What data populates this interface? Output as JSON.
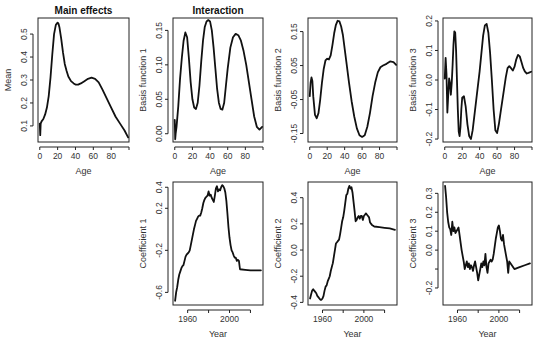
{
  "figure": {
    "column_titles": [
      "Main effects",
      "Interaction"
    ]
  },
  "chart_data": [
    {
      "type": "line",
      "panel": "top-1",
      "title": "Main effects",
      "xlabel": "Age",
      "ylabel": "Mean",
      "xlim": [
        -2,
        100
      ],
      "ylim": [
        0.03,
        0.57
      ],
      "xticks": [
        0,
        20,
        40,
        60,
        80,
        100
      ],
      "xtick_labels": [
        "0",
        "20",
        "40",
        "60",
        "80",
        ""
      ],
      "yticks": [
        0.1,
        0.2,
        0.3,
        0.4,
        0.5
      ],
      "ytick_labels": [
        "0.1",
        "0.2",
        "0.3",
        "0.4",
        "0.5"
      ],
      "x": [
        0,
        0.5,
        1,
        2,
        4,
        6,
        8,
        10,
        12,
        14,
        16,
        18,
        20,
        21,
        22,
        24,
        26,
        28,
        30,
        32,
        35,
        38,
        40,
        43,
        46,
        50,
        54,
        58,
        62,
        66,
        70,
        75,
        80,
        85,
        90,
        95,
        99
      ],
      "y": [
        0.11,
        0.06,
        0.11,
        0.12,
        0.13,
        0.15,
        0.18,
        0.23,
        0.31,
        0.41,
        0.5,
        0.54,
        0.55,
        0.545,
        0.53,
        0.48,
        0.42,
        0.37,
        0.34,
        0.315,
        0.295,
        0.285,
        0.28,
        0.28,
        0.285,
        0.295,
        0.305,
        0.31,
        0.305,
        0.29,
        0.26,
        0.22,
        0.18,
        0.14,
        0.11,
        0.08,
        0.05
      ]
    },
    {
      "type": "line",
      "panel": "top-2",
      "title": "Interaction",
      "xlabel": "Age",
      "ylabel": "Basis function 1",
      "xlim": [
        -2,
        100
      ],
      "ylim": [
        -0.012,
        0.168
      ],
      "xticks": [
        0,
        20,
        40,
        60,
        80,
        100
      ],
      "xtick_labels": [
        "0",
        "20",
        "40",
        "60",
        "80",
        ""
      ],
      "yticks": [
        0.0,
        0.05,
        0.1,
        0.15
      ],
      "ytick_labels": [
        "0.00",
        "0.05",
        "0.10",
        "0.15"
      ],
      "x": [
        0,
        0.5,
        1,
        2,
        4,
        6,
        8,
        10,
        12,
        14,
        16,
        18,
        20,
        22,
        24,
        26,
        28,
        30,
        32,
        34,
        36,
        38,
        40,
        42,
        44,
        46,
        48,
        50,
        52,
        54,
        56,
        58,
        60,
        63,
        66,
        69,
        72,
        75,
        78,
        81,
        84,
        87,
        90,
        93,
        96,
        99
      ],
      "y": [
        0.02,
        -0.008,
        0.0,
        0.01,
        0.04,
        0.08,
        0.11,
        0.135,
        0.147,
        0.14,
        0.11,
        0.075,
        0.05,
        0.038,
        0.036,
        0.045,
        0.07,
        0.105,
        0.135,
        0.155,
        0.163,
        0.165,
        0.163,
        0.15,
        0.125,
        0.095,
        0.065,
        0.045,
        0.036,
        0.035,
        0.045,
        0.07,
        0.095,
        0.125,
        0.14,
        0.145,
        0.143,
        0.135,
        0.12,
        0.1,
        0.075,
        0.05,
        0.025,
        0.01,
        0.006,
        0.01
      ]
    },
    {
      "type": "line",
      "panel": "top-3",
      "xlabel": "Age",
      "ylabel": "Basis function 2",
      "xlim": [
        -2,
        100
      ],
      "ylim": [
        -0.175,
        0.19
      ],
      "xticks": [
        0,
        20,
        40,
        60,
        80,
        100
      ],
      "xtick_labels": [
        "0",
        "20",
        "40",
        "60",
        "80",
        ""
      ],
      "yticks": [
        -0.15,
        -0.05,
        0.05,
        0.15
      ],
      "ytick_labels": [
        "-0.15",
        "-0.05",
        "0.05",
        "0.15"
      ],
      "x": [
        0,
        1,
        2,
        3,
        4,
        6,
        8,
        10,
        12,
        14,
        16,
        18,
        20,
        22,
        24,
        26,
        28,
        30,
        32,
        34,
        36,
        38,
        40,
        42,
        45,
        48,
        51,
        54,
        57,
        60,
        63,
        66,
        69,
        72,
        75,
        78,
        81,
        84,
        88,
        92,
        96,
        99
      ],
      "y": [
        -0.04,
        0.0,
        0.015,
        0.005,
        -0.04,
        -0.095,
        -0.105,
        -0.09,
        -0.05,
        0.0,
        0.04,
        0.065,
        0.07,
        0.068,
        0.08,
        0.11,
        0.145,
        0.17,
        0.182,
        0.18,
        0.165,
        0.14,
        0.1,
        0.06,
        0.0,
        -0.055,
        -0.1,
        -0.135,
        -0.155,
        -0.16,
        -0.155,
        -0.13,
        -0.09,
        -0.04,
        0.0,
        0.03,
        0.045,
        0.05,
        0.055,
        0.062,
        0.06,
        0.052
      ]
    },
    {
      "type": "line",
      "panel": "top-4",
      "xlabel": "Age",
      "ylabel": "Basis function 3",
      "xlim": [
        -2,
        100
      ],
      "ylim": [
        -0.21,
        0.21
      ],
      "xticks": [
        0,
        20,
        40,
        60,
        80,
        100
      ],
      "xtick_labels": [
        "0",
        "20",
        "40",
        "60",
        "80",
        ""
      ],
      "yticks": [
        -0.2,
        -0.1,
        0.0,
        0.1,
        0.2
      ],
      "ytick_labels": [
        "-0.2",
        "-0.1",
        "0.0",
        "0.1",
        "0.2"
      ],
      "x": [
        0,
        1,
        2,
        3,
        4,
        5,
        6,
        7,
        8,
        9,
        10,
        11,
        12,
        13,
        14,
        15,
        16,
        17,
        18,
        19,
        20,
        22,
        24,
        26,
        28,
        30,
        32,
        34,
        36,
        38,
        40,
        42,
        44,
        46,
        48,
        50,
        52,
        54,
        56,
        58,
        60,
        62,
        64,
        66,
        68,
        70,
        72,
        74,
        76,
        78,
        80,
        82,
        84,
        86,
        88,
        90,
        92,
        94,
        96,
        99
      ],
      "y": [
        0.005,
        0.075,
        0.02,
        -0.11,
        -0.05,
        0.005,
        -0.01,
        -0.05,
        -0.01,
        0.05,
        0.12,
        0.165,
        0.16,
        0.1,
        0.0,
        -0.1,
        -0.175,
        -0.19,
        -0.16,
        -0.1,
        -0.06,
        -0.055,
        -0.09,
        -0.15,
        -0.19,
        -0.2,
        -0.17,
        -0.12,
        -0.07,
        -0.02,
        0.03,
        0.09,
        0.15,
        0.185,
        0.19,
        0.16,
        0.09,
        0.0,
        -0.1,
        -0.17,
        -0.18,
        -0.15,
        -0.11,
        -0.07,
        -0.03,
        0.01,
        0.04,
        0.047,
        0.04,
        0.032,
        0.045,
        0.07,
        0.085,
        0.08,
        0.06,
        0.04,
        0.028,
        0.022,
        0.024,
        0.028
      ]
    },
    {
      "type": "line",
      "panel": "bottom-2",
      "xlabel": "Year",
      "ylabel": "Coefficient 1",
      "xlim": [
        1946,
        2032
      ],
      "ylim": [
        -0.72,
        0.45
      ],
      "xticks": [
        1960,
        1980,
        2000,
        2020
      ],
      "xtick_labels": [
        "1960",
        "",
        "2000",
        ""
      ],
      "yticks": [
        -0.6,
        -0.2,
        0.2,
        0.4
      ],
      "ytick_labels": [
        "-0.6",
        "-0.2",
        "0.2",
        "0.4"
      ],
      "x": [
        1948,
        1949,
        1950,
        1951,
        1952,
        1953,
        1954,
        1955,
        1956,
        1957,
        1958,
        1959,
        1960,
        1961,
        1962,
        1963,
        1964,
        1965,
        1966,
        1967,
        1968,
        1969,
        1970,
        1971,
        1972,
        1973,
        1974,
        1975,
        1976,
        1977,
        1978,
        1979,
        1980,
        1981,
        1982,
        1983,
        1984,
        1985,
        1986,
        1987,
        1988,
        1989,
        1990,
        1991,
        1992,
        1993,
        1994,
        1995,
        1996,
        1997,
        1998,
        1999,
        2000,
        2001,
        2002,
        2003,
        2004,
        2005,
        2006,
        2007,
        2008,
        2009,
        2010,
        2015,
        2020,
        2025,
        2030
      ],
      "y": [
        -0.68,
        -0.6,
        -0.55,
        -0.48,
        -0.43,
        -0.4,
        -0.37,
        -0.35,
        -0.34,
        -0.3,
        -0.26,
        -0.24,
        -0.23,
        -0.22,
        -0.2,
        -0.15,
        -0.1,
        -0.05,
        0.0,
        0.04,
        0.08,
        0.1,
        0.12,
        0.13,
        0.13,
        0.16,
        0.2,
        0.25,
        0.28,
        0.3,
        0.31,
        0.32,
        0.36,
        0.32,
        0.33,
        0.3,
        0.28,
        0.26,
        0.32,
        0.39,
        0.41,
        0.36,
        0.38,
        0.37,
        0.4,
        0.42,
        0.41,
        0.39,
        0.35,
        0.27,
        0.15,
        0.02,
        -0.08,
        -0.15,
        -0.2,
        -0.22,
        -0.25,
        -0.27,
        -0.27,
        -0.3,
        -0.29,
        -0.3,
        -0.38,
        -0.385,
        -0.39,
        -0.39,
        -0.39
      ]
    },
    {
      "type": "line",
      "panel": "bottom-3",
      "xlabel": "Year",
      "ylabel": "Coefficient 2",
      "xlim": [
        1946,
        2032
      ],
      "ylim": [
        -0.42,
        0.52
      ],
      "xticks": [
        1960,
        1980,
        2000,
        2020
      ],
      "xtick_labels": [
        "1960",
        "",
        "2000",
        ""
      ],
      "yticks": [
        -0.4,
        -0.2,
        0.0,
        0.2,
        0.4
      ],
      "ytick_labels": [
        "-0.4",
        "-0.2",
        "0.0",
        "0.2",
        "0.4"
      ],
      "x": [
        1948,
        1949,
        1950,
        1951,
        1952,
        1953,
        1954,
        1955,
        1956,
        1957,
        1958,
        1959,
        1960,
        1961,
        1962,
        1963,
        1964,
        1965,
        1966,
        1967,
        1968,
        1969,
        1970,
        1971,
        1972,
        1973,
        1974,
        1975,
        1976,
        1977,
        1978,
        1979,
        1980,
        1981,
        1982,
        1983,
        1984,
        1985,
        1986,
        1987,
        1988,
        1989,
        1990,
        1991,
        1992,
        1993,
        1994,
        1995,
        1996,
        1997,
        1998,
        1999,
        2000,
        2001,
        2002,
        2003,
        2004,
        2005,
        2006,
        2007,
        2008,
        2009,
        2010,
        2015,
        2020,
        2025,
        2030
      ],
      "y": [
        -0.37,
        -0.34,
        -0.31,
        -0.3,
        -0.31,
        -0.32,
        -0.33,
        -0.35,
        -0.36,
        -0.37,
        -0.38,
        -0.38,
        -0.37,
        -0.35,
        -0.31,
        -0.28,
        -0.27,
        -0.24,
        -0.22,
        -0.2,
        -0.16,
        -0.13,
        -0.1,
        -0.05,
        0.0,
        0.05,
        0.06,
        0.07,
        0.08,
        0.12,
        0.17,
        0.22,
        0.25,
        0.3,
        0.36,
        0.42,
        0.43,
        0.47,
        0.49,
        0.47,
        0.48,
        0.44,
        0.37,
        0.3,
        0.22,
        0.23,
        0.25,
        0.26,
        0.24,
        0.26,
        0.26,
        0.23,
        0.26,
        0.27,
        0.28,
        0.27,
        0.26,
        0.25,
        0.21,
        0.2,
        0.19,
        0.185,
        0.18,
        0.175,
        0.17,
        0.165,
        0.155
      ]
    },
    {
      "type": "line",
      "panel": "bottom-4",
      "xlabel": "Year",
      "ylabel": "Coefficient 3",
      "xlim": [
        1946,
        2032
      ],
      "ylim": [
        -0.29,
        0.36
      ],
      "xticks": [
        1960,
        1980,
        2000,
        2020
      ],
      "xtick_labels": [
        "1960",
        "",
        "2000",
        ""
      ],
      "yticks": [
        -0.2,
        -0.1,
        0.0,
        0.1,
        0.2,
        0.3
      ],
      "ytick_labels": [
        "-0.2",
        "",
        "0.0",
        "0.1",
        "0.2",
        "0.3"
      ],
      "x": [
        1948,
        1949,
        1950,
        1951,
        1952,
        1953,
        1954,
        1955,
        1956,
        1957,
        1958,
        1959,
        1960,
        1961,
        1962,
        1963,
        1964,
        1965,
        1966,
        1967,
        1968,
        1969,
        1970,
        1971,
        1972,
        1973,
        1974,
        1975,
        1976,
        1977,
        1978,
        1979,
        1980,
        1981,
        1982,
        1983,
        1984,
        1985,
        1986,
        1987,
        1988,
        1989,
        1990,
        1991,
        1992,
        1993,
        1994,
        1995,
        1996,
        1997,
        1998,
        1999,
        2000,
        2001,
        2002,
        2003,
        2004,
        2005,
        2006,
        2007,
        2008,
        2009,
        2010,
        2015,
        2020,
        2025,
        2030
      ],
      "y": [
        0.34,
        0.28,
        0.2,
        0.15,
        0.12,
        0.11,
        0.08,
        0.15,
        0.1,
        0.12,
        0.09,
        0.1,
        0.11,
        0.12,
        0.08,
        0.04,
        0.0,
        -0.03,
        -0.06,
        -0.1,
        -0.08,
        -0.06,
        -0.09,
        -0.07,
        -0.1,
        -0.08,
        -0.09,
        -0.11,
        -0.08,
        -0.06,
        -0.09,
        -0.12,
        -0.16,
        -0.13,
        -0.1,
        -0.07,
        -0.09,
        -0.06,
        -0.08,
        -0.02,
        -0.09,
        -0.12,
        -0.07,
        -0.06,
        -0.05,
        -0.06,
        -0.05,
        -0.02,
        0.02,
        0.06,
        0.09,
        0.12,
        0.13,
        0.1,
        0.06,
        0.05,
        0.08,
        0.03,
        0.0,
        -0.03,
        -0.06,
        -0.12,
        -0.06,
        -0.1,
        -0.09,
        -0.08,
        -0.07
      ]
    }
  ]
}
